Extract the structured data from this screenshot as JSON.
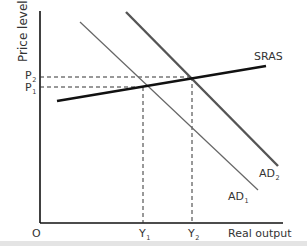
{
  "diagram": {
    "type": "AD-AS shift diagram",
    "axes": {
      "y_label": "Price level",
      "x_label": "Real output",
      "origin_label": "O"
    },
    "price_levels": [
      {
        "base": "P",
        "sub": "1"
      },
      {
        "base": "P",
        "sub": "2"
      }
    ],
    "output_levels": [
      {
        "base": "Y",
        "sub": "1"
      },
      {
        "base": "Y",
        "sub": "2"
      }
    ],
    "curves": {
      "sras": {
        "label": "SRAS"
      },
      "ad1": {
        "base": "AD",
        "sub": "1"
      },
      "ad2": {
        "base": "AD",
        "sub": "2"
      }
    },
    "colors": {
      "axis": "#111111",
      "sras": "#111111",
      "ad1": "#666666",
      "ad2": "#555555",
      "guide": "#333333"
    }
  }
}
